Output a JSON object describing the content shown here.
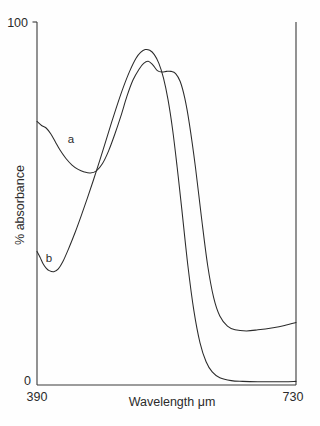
{
  "chart_data": {
    "type": "line",
    "title": "",
    "subtitle": "",
    "xlabel": "Wavelength μm",
    "ylabel": "% absorbance",
    "xlim": [
      390,
      730
    ],
    "ylim": [
      0,
      100
    ],
    "xticks": [
      390,
      730
    ],
    "xticklabels": [
      "390",
      "730"
    ],
    "yticks": [
      0,
      100
    ],
    "yticklabels": [
      "0",
      "100"
    ],
    "grid": false,
    "legend": "inline-curve-labels",
    "annotations": [
      {
        "text": "a",
        "x": 430,
        "y": 68
      },
      {
        "text": "b",
        "x": 411,
        "y": 36
      }
    ],
    "series": [
      {
        "name": "a",
        "label": "a",
        "color": "#2b2b2b",
        "x": [
          390,
          396,
          402,
          408,
          414,
          420,
          428,
          436,
          444,
          452,
          460,
          468,
          476,
          484,
          492,
          500,
          508,
          516,
          524,
          530,
          536,
          542,
          548,
          554,
          560,
          566,
          572,
          578,
          584,
          590,
          598,
          606,
          614,
          622,
          630,
          640,
          650,
          665,
          680,
          700,
          715,
          730
        ],
        "y": [
          72.6,
          71.5,
          70.8,
          69.2,
          67.0,
          64.8,
          62.4,
          60.6,
          59.4,
          58.7,
          58.4,
          59.0,
          61.0,
          64.5,
          69.0,
          74.0,
          79.5,
          84.0,
          87.0,
          88.6,
          89.2,
          88.2,
          86.6,
          86.2,
          86.4,
          86.4,
          85.8,
          83.6,
          79.0,
          72.0,
          60.0,
          46.0,
          33.0,
          24.0,
          19.0,
          16.2,
          15.2,
          14.9,
          15.2,
          15.8,
          16.4,
          17.2
        ]
      },
      {
        "name": "b",
        "label": "b",
        "color": "#2b2b2b",
        "x": [
          390,
          394,
          398,
          402,
          406,
          412,
          418,
          424,
          432,
          440,
          448,
          456,
          464,
          472,
          480,
          488,
          496,
          504,
          512,
          520,
          526,
          532,
          538,
          544,
          550,
          556,
          562,
          568,
          574,
          580,
          588,
          596,
          604,
          612,
          620,
          630,
          645,
          660,
          680,
          700,
          715,
          730
        ],
        "y": [
          36.8,
          35.2,
          33.4,
          32.2,
          31.5,
          31.2,
          32.0,
          34.0,
          37.8,
          42.0,
          46.6,
          51.4,
          56.4,
          61.6,
          67.0,
          72.4,
          77.6,
          82.4,
          86.6,
          90.0,
          91.6,
          92.4,
          92.2,
          91.0,
          88.6,
          84.6,
          78.6,
          70.4,
          60.0,
          48.6,
          33.0,
          20.4,
          11.6,
          6.4,
          3.6,
          2.0,
          1.2,
          1.0,
          0.9,
          0.9,
          0.9,
          1.0
        ]
      }
    ]
  },
  "axes": {
    "y_top_label": "100",
    "y_bottom_label": "0",
    "x_left_label": "390",
    "x_right_label": "730",
    "x_title": "Wavelength μm",
    "y_title": "% absorbance"
  },
  "curve_labels": {
    "a": "a",
    "b": "b"
  },
  "colors": {
    "curve": "#2b2b2b",
    "axis": "#3a3a3a",
    "background": "#fefefe"
  }
}
